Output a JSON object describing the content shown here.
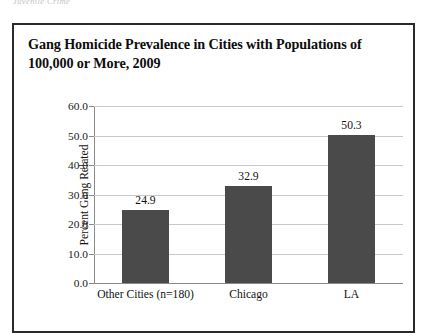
{
  "page": {
    "running_header": "Juvenile Crime"
  },
  "figure": {
    "title": "Gang Homicide Prevalence in Cities with Populations of 100,000 or More, 2009"
  },
  "colors": {
    "bar": "#4a4a4a",
    "gridline": "#c9c9c9",
    "axis": "#8a8a8a",
    "frame": "#2a2a2a",
    "text": "#121212"
  },
  "chart_data": {
    "type": "bar",
    "title": "Gang Homicide Prevalence in Cities with Populations of 100,000 or More, 2009",
    "xlabel": "",
    "ylabel": "Percent Gang Related",
    "categories": [
      "Other Cities (n=180)",
      "Chicago",
      "LA"
    ],
    "values": [
      24.9,
      32.9,
      50.3
    ],
    "value_labels": [
      "24.9",
      "32.9",
      "50.3"
    ],
    "ylim": [
      0.0,
      60.0
    ],
    "ytick_values": [
      0.0,
      10.0,
      20.0,
      30.0,
      40.0,
      50.0,
      60.0
    ],
    "ytick_labels": [
      "0.0",
      "10.0",
      "20.0",
      "30.0",
      "40.0",
      "50.0",
      "60.0"
    ],
    "grid": true,
    "grid_axis": "y",
    "legend": false,
    "legend_position": "none",
    "bar_color": "#4a4a4a"
  }
}
